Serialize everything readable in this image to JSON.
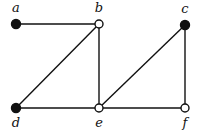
{
  "diagram": {
    "type": "graph",
    "nodes": [
      {
        "id": "a",
        "label": "a",
        "x": 16,
        "y": 24,
        "filled": true,
        "lx": 16,
        "ly": 12
      },
      {
        "id": "b",
        "label": "b",
        "x": 99,
        "y": 24,
        "filled": false,
        "lx": 99,
        "ly": 12
      },
      {
        "id": "c",
        "label": "c",
        "x": 185,
        "y": 25,
        "filled": true,
        "lx": 185,
        "ly": 13
      },
      {
        "id": "d",
        "label": "d",
        "x": 16,
        "y": 108,
        "filled": true,
        "lx": 16,
        "ly": 127
      },
      {
        "id": "e",
        "label": "e",
        "x": 99,
        "y": 108,
        "filled": false,
        "lx": 99,
        "ly": 127
      },
      {
        "id": "f",
        "label": "f",
        "x": 185,
        "y": 108,
        "filled": false,
        "lx": 185,
        "ly": 127
      }
    ],
    "edges": [
      [
        "a",
        "b"
      ],
      [
        "b",
        "d"
      ],
      [
        "b",
        "e"
      ],
      [
        "d",
        "e"
      ],
      [
        "e",
        "c"
      ],
      [
        "e",
        "f"
      ],
      [
        "c",
        "f"
      ]
    ],
    "colors": {
      "stroke": "#111111",
      "fill": "#111111",
      "hollow": "#ffffff"
    }
  }
}
